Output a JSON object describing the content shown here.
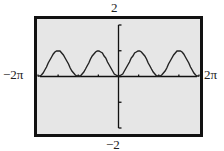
{
  "window": {
    "xmin_label": "−2π",
    "xmax_label": "2π",
    "ymax_label": "2",
    "ymin_label": "−2"
  },
  "colors": {
    "screen_background": "#e6e6e6",
    "frame": "#111111",
    "curve": "#222222",
    "page_background": "#ffffff"
  },
  "chart_data": {
    "type": "line",
    "title": "",
    "function": "y = sin^2(x)",
    "xlabel": "",
    "ylabel": "",
    "xlim": [
      -6.2832,
      6.2832
    ],
    "ylim": [
      -2,
      2
    ],
    "xlim_labels": [
      "−2π",
      "2π"
    ],
    "ylim_labels": [
      "−2",
      "2"
    ],
    "x_tick_step": "π/2",
    "y_tick_step": 1,
    "grid": false,
    "legend": null,
    "series": [
      {
        "name": "sin^2(x)",
        "x": [
          -6.2832,
          -5.4978,
          -4.7124,
          -3.927,
          -3.1416,
          -2.3562,
          -1.5708,
          -0.7854,
          0,
          0.7854,
          1.5708,
          2.3562,
          3.1416,
          3.927,
          4.7124,
          5.4978,
          6.2832
        ],
        "values": [
          0,
          0.5,
          1,
          0.5,
          0,
          0.5,
          1,
          0.5,
          0,
          0.5,
          1,
          0.5,
          0,
          0.5,
          1,
          0.5,
          0
        ]
      }
    ]
  }
}
